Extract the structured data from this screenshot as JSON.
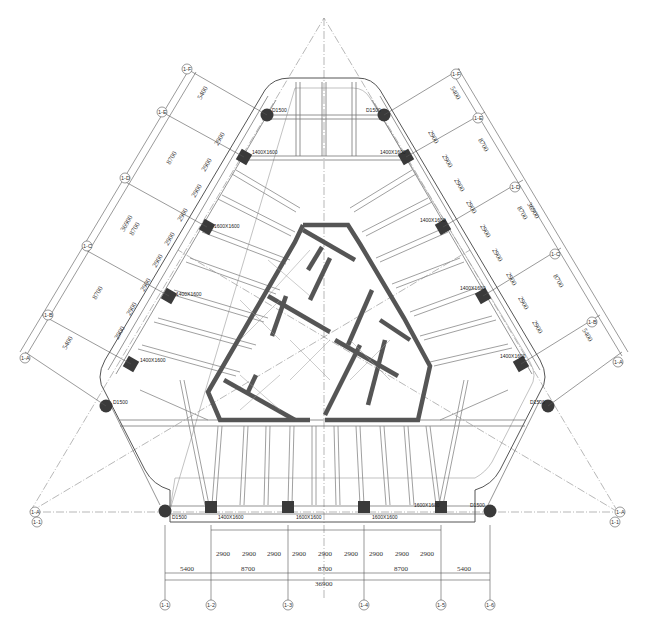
{
  "drawing": {
    "type": "structural-floor-plan",
    "shape": "triangular-tower",
    "colors": {
      "background": "#ffffff",
      "line": "#555555",
      "column": "#3a3a3a",
      "core_wall": "#555555",
      "axis": "#777777"
    }
  },
  "axes": {
    "bottom": [
      "1-1",
      "1-2",
      "1-3",
      "1-4",
      "1-5",
      "1-6"
    ],
    "left": [
      "1-A",
      "1-B",
      "1-C",
      "1-D",
      "1-E",
      "1-F"
    ],
    "right": [
      "1-A",
      "1-B",
      "1-C",
      "1-D",
      "1-E",
      "1-F"
    ],
    "corner_left": [
      "1-A",
      "1-1"
    ],
    "corner_right": [
      "1-A",
      "1-1"
    ]
  },
  "dimensions": {
    "bottom_sub": [
      "2900",
      "2900",
      "2900",
      "2900",
      "2900",
      "2900",
      "2900",
      "2900",
      "2900"
    ],
    "bottom_bays": [
      "5400",
      "8700",
      "8700",
      "8700",
      "5400"
    ],
    "bottom_total": "36900",
    "left_bays": [
      "5400",
      "8700",
      "8700",
      "8700",
      "5400"
    ],
    "left_total": "36900",
    "left_sub": [
      "2900",
      "2900",
      "2900",
      "2900",
      "2900",
      "2900",
      "2900",
      "2900",
      "2900"
    ],
    "right_bays": [
      "5400",
      "8700",
      "8700",
      "8700",
      "5400"
    ],
    "right_total": "36900",
    "right_sub": [
      "2900",
      "2900",
      "2900",
      "2900",
      "2900",
      "2900",
      "2900",
      "2900",
      "2900"
    ]
  },
  "columns": {
    "round_label": "D1500",
    "square_label": "1400X1600",
    "square_alt_label": "1600X1600"
  }
}
